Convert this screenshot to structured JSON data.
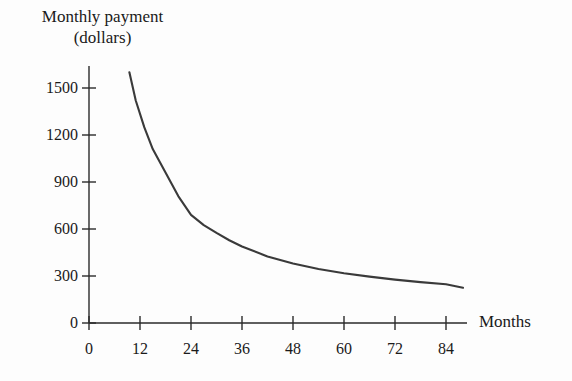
{
  "chart_data": {
    "type": "line",
    "title": "",
    "ylabel": "Monthly payment (dollars)",
    "ylabel_lines": [
      "Monthly payment",
      "(dollars)"
    ],
    "xlabel": "Months",
    "xlim": [
      0,
      90
    ],
    "ylim": [
      0,
      1650
    ],
    "grid": false,
    "legend": null,
    "xticks": [
      0,
      12,
      24,
      36,
      48,
      60,
      72,
      84
    ],
    "xtick_labels": [
      "0",
      "12",
      "24",
      "36",
      "48",
      "60",
      "72",
      "84"
    ],
    "yticks": [
      0,
      300,
      600,
      900,
      1200,
      1500
    ],
    "ytick_labels": [
      "0",
      "300",
      "600",
      "900",
      "1200",
      "1500"
    ],
    "series": [
      {
        "name": "Monthly payment",
        "color": "#3a3a3a",
        "x": [
          9.5,
          11,
          13,
          15,
          18,
          21,
          24,
          27,
          30,
          33,
          36,
          42,
          48,
          54,
          60,
          66,
          72,
          78,
          84,
          88
        ],
        "y": [
          1600,
          1420,
          1250,
          1110,
          960,
          810,
          690,
          625,
          575,
          528,
          488,
          425,
          380,
          345,
          318,
          296,
          277,
          261,
          247,
          225
        ]
      }
    ]
  },
  "axes": {
    "y_axis_name": "y-axis",
    "x_axis_name": "x-axis"
  }
}
